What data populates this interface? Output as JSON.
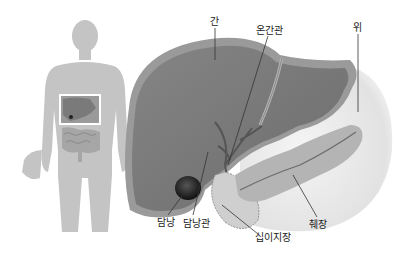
{
  "diagram": {
    "type": "anatomical-illustration",
    "colors": {
      "silhouette": "#c4c4c4",
      "liver": "#777777",
      "liver_rim": "#9a9a9a",
      "stomach": "#e6e6e6",
      "pancreas": "#b4b4b4",
      "gallbladder": "#1e1e1e",
      "duodenum": "#cfcfcf",
      "leader_line": "#333333"
    },
    "labels": [
      {
        "id": "liver",
        "text": "간",
        "x": 210,
        "y": 18
      },
      {
        "id": "common-hepatic-duct",
        "text": "온간관",
        "x": 258,
        "y": 27
      },
      {
        "id": "stomach",
        "text": "위",
        "x": 354,
        "y": 24
      },
      {
        "id": "gallbladder",
        "text": "담낭",
        "x": 158,
        "y": 219
      },
      {
        "id": "cystic-duct",
        "text": "담낭관",
        "x": 183,
        "y": 220
      },
      {
        "id": "pancreas",
        "text": "췌장",
        "x": 310,
        "y": 221
      },
      {
        "id": "duodenum",
        "text": "십이지장",
        "x": 255,
        "y": 234
      }
    ]
  }
}
